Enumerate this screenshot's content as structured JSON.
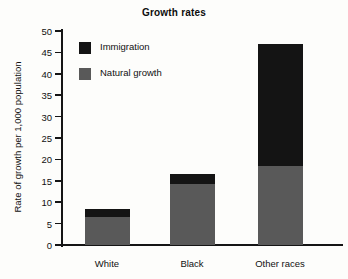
{
  "chart_data": {
    "type": "bar",
    "subtype": "stacked-vertical-bar",
    "title": "Growth rates",
    "xlabel": "",
    "ylabel": "Rate of growth per 1,000 population",
    "categories": [
      "White",
      "Black",
      "Other races"
    ],
    "series": [
      {
        "name": "Natural growth",
        "color": "#595959",
        "values": [
          6.5,
          14.2,
          18.5
        ]
      },
      {
        "name": "Immigration",
        "color": "#141414",
        "values": [
          2.0,
          2.3,
          28.5
        ]
      }
    ],
    "stack_totals": [
      8.5,
      16.5,
      47.0
    ],
    "ylim": [
      0,
      50
    ],
    "ytick_step": 5,
    "yticks": [
      0,
      5,
      10,
      15,
      20,
      25,
      30,
      35,
      40,
      45,
      50
    ],
    "ytick_labels": [
      "0",
      "5",
      "10",
      "15",
      "20",
      "25",
      "30",
      "35",
      "40",
      "45",
      "50"
    ],
    "grid": false,
    "legend_position": "upper-left-inside",
    "legend_order": [
      "Immigration",
      "Natural growth"
    ]
  },
  "legend": {
    "items": [
      {
        "label": "Immigration",
        "swatch": "black"
      },
      {
        "label": "Natural growth",
        "swatch": "gray"
      }
    ]
  },
  "colors": {
    "immigration": "#141414",
    "natural_growth": "#595959",
    "axis": "#151515",
    "background": "#fdfdfb",
    "text": "#111111"
  }
}
